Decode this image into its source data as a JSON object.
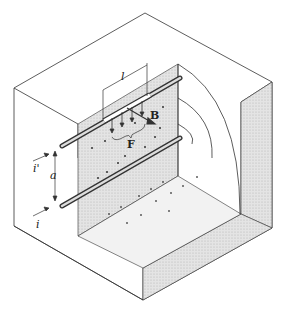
{
  "diagram": {
    "type": "isometric-physics-illustration",
    "colors": {
      "line": "#333333",
      "shade": "#d9d9d9",
      "shade_dark": "#c8c8c8",
      "background": "#ffffff"
    },
    "labels": {
      "length": "l",
      "field": "B",
      "force": "F",
      "separation": "a",
      "current_top": "i'",
      "current_bottom": "i"
    }
  }
}
